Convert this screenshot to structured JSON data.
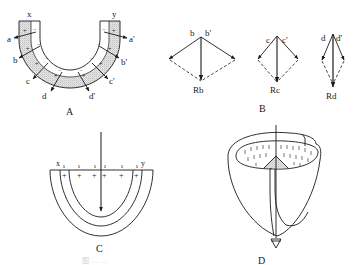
{
  "figure": {
    "panels": {
      "A": {
        "label": "A",
        "top_labels": {
          "left": "x",
          "right": "y"
        },
        "vector_labels_left": [
          "a",
          "b",
          "c",
          "d"
        ],
        "vector_labels_right": [
          "a'",
          "b'",
          "c'",
          "d'"
        ],
        "signs": {
          "inner": "−",
          "outer": "+"
        }
      },
      "B": {
        "label": "B",
        "groups": [
          {
            "left": "b",
            "right": "b'",
            "resultant": "Rb"
          },
          {
            "left": "c",
            "right": "c'",
            "resultant": "Rc"
          },
          {
            "left": "d",
            "right": "d'",
            "resultant": "Rd"
          }
        ]
      },
      "C": {
        "label": "C",
        "top_labels": {
          "left": "x",
          "right": "y"
        },
        "signs": {
          "top": "ı",
          "bottom": "+"
        }
      },
      "D": {
        "label": "D"
      }
    },
    "caption": "图 … …"
  },
  "colors": {
    "ink": "#1a1a1a",
    "stipple": "#c8c8c8",
    "background": "#ffffff"
  }
}
